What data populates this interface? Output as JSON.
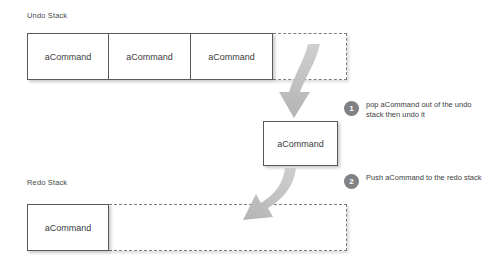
{
  "diagram": {
    "background_color": "#ffffff",
    "accent_color": "#808184",
    "box_border_color": "#58595b",
    "dashed_border_color": "#7d7d7d",
    "arrow_color": "#bdbdbd"
  },
  "undo_section": {
    "caption": "Undo Stack",
    "filled_cells": [
      {
        "label": "aCommand"
      },
      {
        "label": "aCommand"
      },
      {
        "label": "aCommand"
      }
    ],
    "empty_slots": 1
  },
  "popped": {
    "label": "aCommand"
  },
  "redo_section": {
    "caption": "Redo Stack",
    "filled_cells": [
      {
        "label": "aCommand"
      }
    ],
    "empty_slots": 1
  },
  "steps": [
    {
      "number": "1",
      "text": "pop aCommand out of the undo stack then undo it"
    },
    {
      "number": "2",
      "text": "Push aCommand to the redo stack"
    }
  ],
  "arrows": [
    {
      "name": "pop-arrow",
      "from": "undo-stack",
      "to": "popped-command"
    },
    {
      "name": "push-arrow",
      "from": "popped-command",
      "to": "redo-stack"
    }
  ]
}
